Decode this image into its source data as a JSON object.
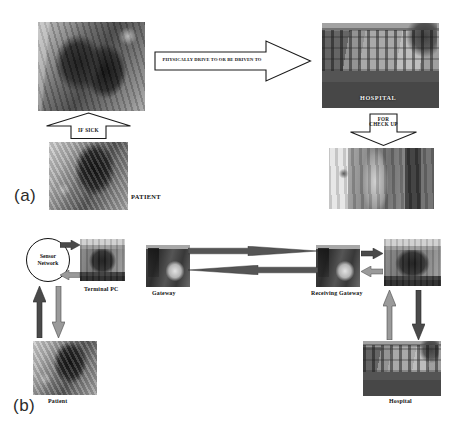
{
  "figure": {
    "background": "#ffffff",
    "ink": "#111111"
  },
  "panels": [
    {
      "id": "a",
      "tag": "(a)",
      "name": "conventional-hospital-visit-flow",
      "nodes": [
        {
          "key": "driving",
          "label": "",
          "photo": "person-driving-car-interior"
        },
        {
          "key": "hospital",
          "label": "HOSPITAL",
          "photo": "hospital-building-exterior",
          "label_style": "overlay"
        },
        {
          "key": "patient",
          "label": "PATIENT",
          "photo": "patient-bending-indoor-scene"
        },
        {
          "key": "checkup",
          "label": "",
          "photo": "blood-pressure-check-up"
        }
      ],
      "arrows": [
        {
          "key": "if-sick",
          "label": "IF SICK",
          "direction": "up",
          "style": "outline"
        },
        {
          "key": "drive-to",
          "label": "PHYSICALLY DRIVE TO OR BE DRIVEN TO",
          "direction": "right",
          "style": "outline"
        },
        {
          "key": "check-up",
          "label": "FOR\nCHECK UP",
          "direction": "down",
          "style": "outline"
        }
      ]
    },
    {
      "id": "b",
      "tag": "(b)",
      "name": "remote-sensor-network-telemonitoring-flow",
      "nodes": [
        {
          "key": "sensor-network",
          "label": "Sensor\nNetwork",
          "shape": "ellipse"
        },
        {
          "key": "terminal-pc",
          "label": "Terminal PC",
          "photo": "terminal-pc-desk"
        },
        {
          "key": "gateway",
          "label": "Gateway",
          "photo": "gateway-device-hand"
        },
        {
          "key": "receiving-gateway",
          "label": "Receiving Gateway",
          "photo": "receiving-gateway-device-hand"
        },
        {
          "key": "hospital-pc",
          "label": "",
          "photo": "hospital-terminal-pc-desk"
        },
        {
          "key": "patient",
          "label": "Patient",
          "photo": "patient-bending-indoor-scene"
        },
        {
          "key": "hospital",
          "label": "Hospital",
          "photo": "hospital-building-exterior"
        }
      ],
      "arrows": [
        {
          "key": "sensor-to-pc",
          "direction": "right",
          "tone": "dark"
        },
        {
          "key": "pc-to-sensor",
          "direction": "left",
          "tone": "light"
        },
        {
          "key": "patient-to-sensor",
          "direction": "up",
          "tone": "dark"
        },
        {
          "key": "sensor-to-patient",
          "direction": "down",
          "tone": "light"
        },
        {
          "key": "gateway-to-receiving",
          "direction": "right",
          "tone": "dark",
          "shape": "long-taper"
        },
        {
          "key": "receiving-to-gateway",
          "direction": "left",
          "tone": "dark",
          "shape": "long-taper"
        },
        {
          "key": "receiving-to-pc",
          "direction": "right",
          "tone": "dark"
        },
        {
          "key": "pc-to-receiving",
          "direction": "left",
          "tone": "light"
        },
        {
          "key": "hospital-to-pc",
          "direction": "up",
          "tone": "light"
        },
        {
          "key": "pc-to-hospital",
          "direction": "down",
          "tone": "dark"
        }
      ]
    }
  ],
  "labels": {
    "a": {
      "if_sick": "IF SICK",
      "drive_to": "PHYSICALLY DRIVE TO OR BE DRIVEN TO",
      "check_up": "FOR\nCHECK UP",
      "hospital": "HOSPITAL",
      "patient": "PATIENT",
      "tag": "(a)"
    },
    "b": {
      "sensor_network": "Sensor\nNetwork",
      "terminal_pc": "Terminal PC",
      "gateway": "Gateway",
      "receiving_gateway": "Receiving Gateway",
      "patient": "Patient",
      "hospital": "Hospital",
      "tag": "(b)"
    }
  },
  "colors": {
    "arrow_dark": "#4a4a4a",
    "arrow_light": "#9a9a9a",
    "outline_stroke": "#1a1a1a",
    "outline_fill": "#ffffff",
    "photo_base": "#8d8d8d"
  }
}
